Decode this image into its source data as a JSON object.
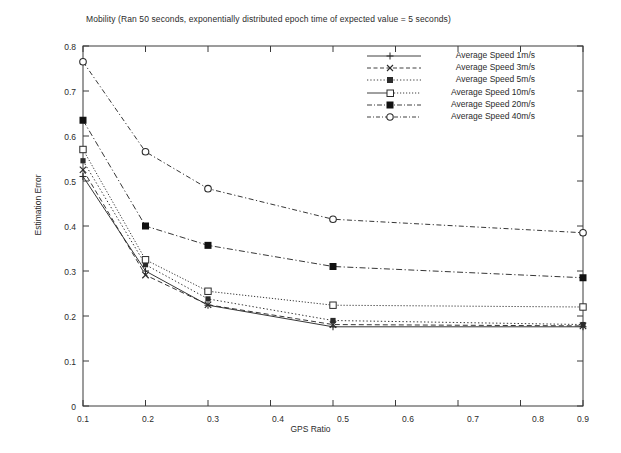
{
  "chart_data": {
    "type": "line",
    "title": "Mobility (Ran 50 seconds, exponentially distributed epoch time of expected value = 5 seconds)",
    "xlabel": "GPS Ratio",
    "ylabel": "Estimation Error",
    "xlim": [
      0.1,
      0.9
    ],
    "ylim": [
      0,
      0.8
    ],
    "xticks": [
      "0.1",
      "0.2",
      "0.3",
      "0.4",
      "0.5",
      "0.6",
      "0.7",
      "0.8",
      "0.9"
    ],
    "yticks": [
      "0",
      "0.1",
      "0.2",
      "0.3",
      "0.4",
      "0.5",
      "0.6",
      "0.7",
      "0.8"
    ],
    "grid": false,
    "legend_position": "top-right",
    "x": [
      0.1,
      0.2,
      0.3,
      0.5,
      0.9
    ],
    "series": [
      {
        "name": "Average Speed 1m/s",
        "marker": "plus",
        "linestyle": "solid",
        "values": [
          0.51,
          0.3,
          0.224,
          0.176,
          0.176
        ]
      },
      {
        "name": "Average Speed 3m/s",
        "marker": "cross",
        "linestyle": "dashed",
        "values": [
          0.525,
          0.291,
          0.225,
          0.181,
          0.178
        ]
      },
      {
        "name": "Average Speed 5m/s",
        "marker": "filled-square-small",
        "linestyle": "dotted",
        "values": [
          0.545,
          0.314,
          0.238,
          0.19,
          0.181
        ]
      },
      {
        "name": "Average Speed 10m/s",
        "marker": "open-square",
        "linestyle": "dotted-fine",
        "values": [
          0.57,
          0.325,
          0.255,
          0.224,
          0.22
        ]
      },
      {
        "name": "Average Speed 20m/s",
        "marker": "filled-square",
        "linestyle": "dash-dot",
        "values": [
          0.635,
          0.4,
          0.357,
          0.31,
          0.285
        ]
      },
      {
        "name": "Average Speed 40m/s",
        "marker": "open-circle",
        "linestyle": "dash-dot-long",
        "values": [
          0.765,
          0.565,
          0.483,
          0.415,
          0.385
        ]
      }
    ]
  },
  "axis": {
    "title": "Mobility (Ran 50 seconds, exponentially distributed epoch time of expected value = 5 seconds)",
    "xlabel": "GPS Ratio",
    "ylabel": "Estimation Error"
  }
}
